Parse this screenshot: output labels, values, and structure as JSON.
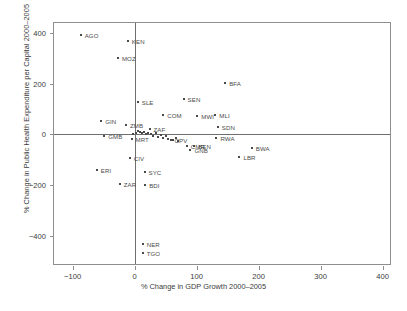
{
  "chart_data": {
    "type": "scatter",
    "title": "",
    "xlabel": "% Change in GDP Growth 2000–2005",
    "ylabel": "% Change in Public Health Expenditure per Capital 2000–2005",
    "xlim": [
      -130,
      415
    ],
    "ylim": [
      -520,
      440
    ],
    "xticks": [
      -100,
      0,
      100,
      200,
      300,
      400
    ],
    "xticklabels": [
      "−100",
      "0",
      "100",
      "200",
      "300",
      "400"
    ],
    "yticks": [
      400,
      200,
      0,
      -200,
      -400
    ],
    "yticklabels": [
      "400",
      "200",
      "0",
      "−200",
      "−400"
    ],
    "grid": false,
    "legend": null,
    "reference_lines": {
      "x": 0,
      "y": 0
    },
    "marker_color": "#4a4a4a",
    "axis_color": "#8e8e8e",
    "points": [
      {
        "label": "AGO",
        "x": -87,
        "y": 392,
        "lx": 4,
        "ly": 0
      },
      {
        "label": "KEN",
        "x": -11,
        "y": 370,
        "lx": 4,
        "ly": 0
      },
      {
        "label": "MOZ",
        "x": -27,
        "y": 300,
        "lx": 4,
        "ly": 0
      },
      {
        "label": "BFA",
        "x": 146,
        "y": 202,
        "lx": 4,
        "ly": 0
      },
      {
        "label": "SLE",
        "x": 5,
        "y": 126,
        "lx": 4,
        "ly": 0
      },
      {
        "label": "SEN",
        "x": 79,
        "y": 141,
        "lx": 4,
        "ly": 0
      },
      {
        "label": "COM",
        "x": 46,
        "y": 78,
        "lx": 4,
        "ly": 0
      },
      {
        "label": "MWI",
        "x": 101,
        "y": 72,
        "lx": 4,
        "ly": 0
      },
      {
        "label": "MLI",
        "x": 130,
        "y": 78,
        "lx": 4,
        "ly": 0
      },
      {
        "label": "GIN",
        "x": -54,
        "y": 52,
        "lx": 4,
        "ly": 0
      },
      {
        "label": "ZMB",
        "x": -14,
        "y": 38,
        "lx": 4,
        "ly": 0
      },
      {
        "label": "ZAF",
        "x": 24,
        "y": 22,
        "lx": 4,
        "ly": 0
      },
      {
        "label": "SDN",
        "x": 134,
        "y": 28,
        "lx": 4,
        "ly": 0
      },
      {
        "label": "GMB",
        "x": -49,
        "y": -8,
        "lx": 4,
        "ly": 0
      },
      {
        "label": "MRT",
        "x": -5,
        "y": -18,
        "lx": 4,
        "ly": 0
      },
      {
        "label": "RWA",
        "x": 132,
        "y": -14,
        "lx": 4,
        "ly": 0
      },
      {
        "label": "CPV",
        "x": 58,
        "y": -22,
        "lx": 4,
        "ly": 0
      },
      {
        "label": "CMR",
        "x": 84,
        "y": -44,
        "lx": 4,
        "ly": 0
      },
      {
        "label": "BEN",
        "x": 96,
        "y": -44,
        "lx": 4,
        "ly": 0
      },
      {
        "label": "GNB",
        "x": 90,
        "y": -60,
        "lx": 4,
        "ly": 0
      },
      {
        "label": "BWA",
        "x": 189,
        "y": -52,
        "lx": 4,
        "ly": 0
      },
      {
        "label": "LBR",
        "x": 169,
        "y": -88,
        "lx": 4,
        "ly": 0
      },
      {
        "label": "CIV",
        "x": -8,
        "y": -92,
        "lx": 4,
        "ly": 0
      },
      {
        "label": "ERI",
        "x": -61,
        "y": -142,
        "lx": 4,
        "ly": 0
      },
      {
        "label": "SYC",
        "x": 16,
        "y": -148,
        "lx": 4,
        "ly": 0
      },
      {
        "label": "ZAR",
        "x": -24,
        "y": -196,
        "lx": 4,
        "ly": 0
      },
      {
        "label": "BDI",
        "x": 17,
        "y": -200,
        "lx": 4,
        "ly": 0
      },
      {
        "label": "NER",
        "x": 13,
        "y": -432,
        "lx": 4,
        "ly": 0
      },
      {
        "label": "TGO",
        "x": 13,
        "y": -470,
        "lx": 4,
        "ly": 0
      },
      {
        "label": "",
        "x": 9,
        "y": 8,
        "lx": 0,
        "ly": 0
      },
      {
        "label": "",
        "x": 12,
        "y": 4,
        "lx": 0,
        "ly": 0
      },
      {
        "label": "",
        "x": 15,
        "y": 10,
        "lx": 0,
        "ly": 0
      },
      {
        "label": "",
        "x": 18,
        "y": 2,
        "lx": 0,
        "ly": 0
      },
      {
        "label": "",
        "x": 21,
        "y": 6,
        "lx": 0,
        "ly": 0
      },
      {
        "label": "",
        "x": 27,
        "y": 0,
        "lx": 0,
        "ly": 0
      },
      {
        "label": "",
        "x": 30,
        "y": -6,
        "lx": 0,
        "ly": 0
      },
      {
        "label": "",
        "x": 34,
        "y": 4,
        "lx": 0,
        "ly": 0
      },
      {
        "label": "",
        "x": 38,
        "y": -10,
        "lx": 0,
        "ly": 0
      },
      {
        "label": "",
        "x": 42,
        "y": -2,
        "lx": 0,
        "ly": 0
      },
      {
        "label": "",
        "x": 46,
        "y": -14,
        "lx": 0,
        "ly": 0
      },
      {
        "label": "",
        "x": 50,
        "y": -8,
        "lx": 0,
        "ly": 0
      },
      {
        "label": "",
        "x": 54,
        "y": -18,
        "lx": 0,
        "ly": 0
      },
      {
        "label": "",
        "x": 62,
        "y": -24,
        "lx": 0,
        "ly": 0
      },
      {
        "label": "",
        "x": 66,
        "y": -16,
        "lx": 0,
        "ly": 0
      },
      {
        "label": "",
        "x": 70,
        "y": -28,
        "lx": 0,
        "ly": 0
      },
      {
        "label": "",
        "x": 6,
        "y": 12,
        "lx": 0,
        "ly": 0
      },
      {
        "label": "",
        "x": 2,
        "y": 6,
        "lx": 0,
        "ly": 0
      },
      {
        "label": "",
        "x": -2,
        "y": 2,
        "lx": 0,
        "ly": 0
      }
    ]
  }
}
